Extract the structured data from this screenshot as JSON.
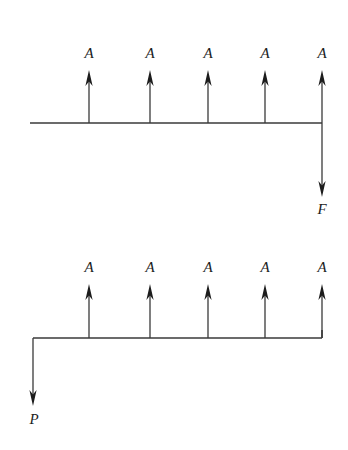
{
  "figure": {
    "background_color": "#ffffff",
    "stroke_color": "#3a3a3a",
    "text_color": "#1c1c1c",
    "width": 348,
    "height": 450
  },
  "diagrams": [
    {
      "id": "upper-free-body-diagram",
      "name": "upper-diagram",
      "beam": {
        "x1": 30,
        "x2": 322,
        "y": 123
      },
      "distributed_loads": [
        {
          "label": "A",
          "x": 89,
          "tail_y": 123,
          "head_y": 72,
          "label_y": 58
        },
        {
          "label": "A",
          "x": 150,
          "tail_y": 123,
          "head_y": 72,
          "label_y": 58
        },
        {
          "label": "A",
          "x": 208,
          "tail_y": 123,
          "head_y": 72,
          "label_y": 58
        },
        {
          "label": "A",
          "x": 265,
          "tail_y": 123,
          "head_y": 72,
          "label_y": 58
        },
        {
          "label": "A",
          "x": 322,
          "tail_y": 123,
          "head_y": 72,
          "label_y": 58
        }
      ],
      "reaction": {
        "label": "F",
        "x": 322,
        "tail_y": 123,
        "head_y": 196,
        "label_x": 322,
        "label_y": 214,
        "direction": "down"
      }
    },
    {
      "id": "lower-free-body-diagram",
      "name": "lower-diagram",
      "beam": {
        "x1": 33,
        "x2": 322,
        "y": 338
      },
      "distributed_loads": [
        {
          "label": "A",
          "x": 89,
          "tail_y": 338,
          "head_y": 286,
          "label_y": 272
        },
        {
          "label": "A",
          "x": 150,
          "tail_y": 338,
          "head_y": 286,
          "label_y": 272
        },
        {
          "label": "A",
          "x": 208,
          "tail_y": 338,
          "head_y": 286,
          "label_y": 272
        },
        {
          "label": "A",
          "x": 265,
          "tail_y": 338,
          "head_y": 286,
          "label_y": 272
        },
        {
          "label": "A",
          "x": 322,
          "tail_y": 338,
          "head_y": 286,
          "label_y": 272
        }
      ],
      "reaction": {
        "label": "P",
        "x": 33,
        "tail_y": 338,
        "head_y": 405,
        "label_x": 34,
        "label_y": 424,
        "direction": "down"
      }
    }
  ]
}
